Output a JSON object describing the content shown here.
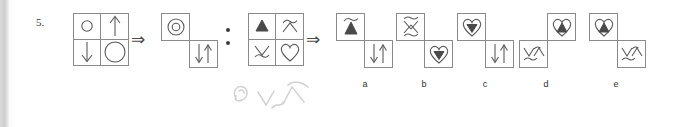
{
  "question": {
    "number": "5.",
    "type": "visual-analogy-matrix-puzzle"
  },
  "separators": {
    "implies_arrow": "⇒",
    "analogy_dots": "∶"
  },
  "problem": {
    "first_pair": {
      "source_matrix": {
        "name": "circles-arrows-matrix",
        "cells": [
          {
            "position": "top-left",
            "symbol": "small-circle"
          },
          {
            "position": "top-right",
            "symbol": "up-arrow"
          },
          {
            "position": "bottom-left",
            "symbol": "down-arrow"
          },
          {
            "position": "bottom-right",
            "symbol": "large-circle"
          }
        ]
      },
      "result_boxes": [
        {
          "position": "top-left",
          "symbol": "concentric-circles"
        },
        {
          "position": "bottom-right",
          "symbol": "down-up-arrows"
        }
      ]
    },
    "second_pair": {
      "source_matrix": {
        "name": "triangle-heart-matrix",
        "cells": [
          {
            "position": "top-left",
            "symbol": "filled-triangle-up"
          },
          {
            "position": "top-right",
            "symbol": "arch-curve"
          },
          {
            "position": "bottom-left",
            "symbol": "valley-curve"
          },
          {
            "position": "bottom-right",
            "symbol": "heart-outline"
          }
        ]
      },
      "result": "unknown"
    }
  },
  "options": [
    {
      "label": "a",
      "boxes": [
        {
          "position": "top-left",
          "symbol": "arch-over-filled-triangle"
        },
        {
          "position": "bottom-right",
          "symbol": "down-up-arrows"
        }
      ]
    },
    {
      "label": "b",
      "boxes": [
        {
          "position": "top-left",
          "symbol": "arch-over-valley-curves"
        },
        {
          "position": "bottom-right",
          "symbol": "heart-with-down-triangle"
        }
      ]
    },
    {
      "label": "c",
      "boxes": [
        {
          "position": "top-left",
          "symbol": "heart-with-down-triangle"
        },
        {
          "position": "bottom-right",
          "symbol": "down-up-arrows"
        }
      ]
    },
    {
      "label": "d",
      "boxes": [
        {
          "position": "top-right",
          "symbol": "heart-with-up-triangle"
        },
        {
          "position": "bottom-left",
          "symbol": "valley-arch-curves"
        }
      ]
    },
    {
      "label": "e",
      "boxes": [
        {
          "position": "top-left",
          "symbol": "heart-with-up-triangle"
        },
        {
          "position": "bottom-right",
          "symbol": "valley-arch-curves"
        }
      ]
    }
  ],
  "annotation": {
    "handwriting": "faint-pencil-sketch-curves"
  },
  "colors": {
    "ink": "#5a5a5a",
    "fill": "#4a4a4a",
    "paper": "#ffffff",
    "scan_edge": "#d0d0d0"
  }
}
